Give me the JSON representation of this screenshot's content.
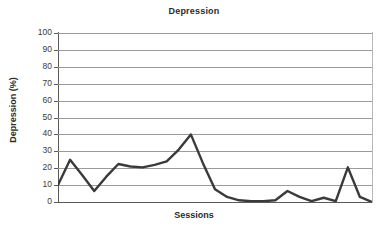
{
  "chart_data": {
    "type": "line",
    "title": "Depression",
    "xlabel": "Sessions",
    "ylabel": "Depression (%)",
    "ylim": [
      0,
      100
    ],
    "ytick_labels": [
      "100",
      "90",
      "80",
      "70",
      "60",
      "50",
      "40",
      "30",
      "20",
      "10",
      "0"
    ],
    "ytick_values": [
      100,
      90,
      80,
      70,
      60,
      50,
      40,
      30,
      20,
      10,
      0
    ],
    "xtick_labels": [],
    "grid": "horizontal",
    "legend": "none",
    "series": [
      {
        "name": "Depression",
        "color": "#3a3a3a",
        "x": [
          1,
          2,
          3,
          4,
          5,
          6,
          7,
          8,
          9,
          10,
          11,
          12,
          13,
          14,
          15,
          16,
          17,
          18,
          19,
          20,
          21,
          22,
          23,
          24,
          25,
          26,
          27
        ],
        "values": [
          10,
          25,
          16,
          6.5,
          15,
          22.5,
          21,
          20.5,
          22,
          24,
          31,
          40,
          23,
          7.5,
          3,
          1,
          0.5,
          0.5,
          1,
          6.5,
          3,
          0.5,
          2.5,
          0.5,
          20.5,
          3,
          0
        ]
      }
    ]
  },
  "colors": {
    "series_line": "#3a3a3a",
    "gridline": "#9b9b9b",
    "axis": "#5a5a5a",
    "text": "#2b2b2b",
    "background": "#ffffff"
  }
}
